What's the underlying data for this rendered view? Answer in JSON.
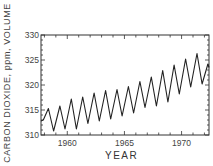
{
  "chart_data": {
    "type": "line",
    "title": "",
    "xlabel": "YEAR",
    "ylabel": "CARBON DIOXIDE, ppm, VOLUME",
    "xlim": [
      1957.7,
      1972.4
    ],
    "ylim": [
      310,
      330
    ],
    "x_ticks": [
      1960,
      1965,
      1970
    ],
    "y_ticks": [
      310,
      315,
      320,
      325,
      330
    ],
    "grid": false,
    "legend": null,
    "series": [
      {
        "name": "Atmospheric CO2 (Mauna Loa)",
        "x": [
          1957.7,
          1957.9,
          1958.35,
          1958.8,
          1959.35,
          1959.8,
          1960.35,
          1960.8,
          1961.35,
          1961.8,
          1962.35,
          1962.8,
          1963.35,
          1963.8,
          1964.35,
          1964.8,
          1965.35,
          1965.8,
          1966.35,
          1966.8,
          1967.35,
          1967.8,
          1968.35,
          1968.8,
          1969.35,
          1969.8,
          1970.35,
          1970.8,
          1971.35,
          1971.8,
          1972.3,
          1972.4
        ],
        "values": [
          312.8,
          313.0,
          315.3,
          310.8,
          315.8,
          311.2,
          317.2,
          311.2,
          317.6,
          312.3,
          318.4,
          312.8,
          318.9,
          313.2,
          319.1,
          313.8,
          319.7,
          314.4,
          320.7,
          315.5,
          321.6,
          315.8,
          322.9,
          316.6,
          324.0,
          318.2,
          325.2,
          319.6,
          326.3,
          320.2,
          324.2,
          323.5
        ]
      }
    ]
  }
}
